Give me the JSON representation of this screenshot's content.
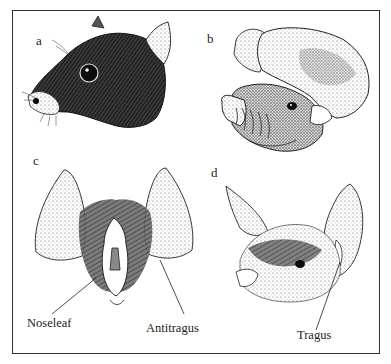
{
  "figure": {
    "panels": [
      {
        "id": "a",
        "label": "a",
        "subject": "bat head in profile (dark furred, small ear)"
      },
      {
        "id": "b",
        "label": "b",
        "subject": "bat head with large rounded ears and ridged muzzle"
      },
      {
        "id": "c",
        "label": "c",
        "subject": "frontal view of bat face with noseleaf and large ears"
      },
      {
        "id": "d",
        "label": "d",
        "subject": "bat head with long pointed ears and tragus"
      }
    ],
    "callouts": {
      "noseleaf": "Noseleaf",
      "antitragus": "Antitragus",
      "tragus": "Tragus"
    }
  }
}
